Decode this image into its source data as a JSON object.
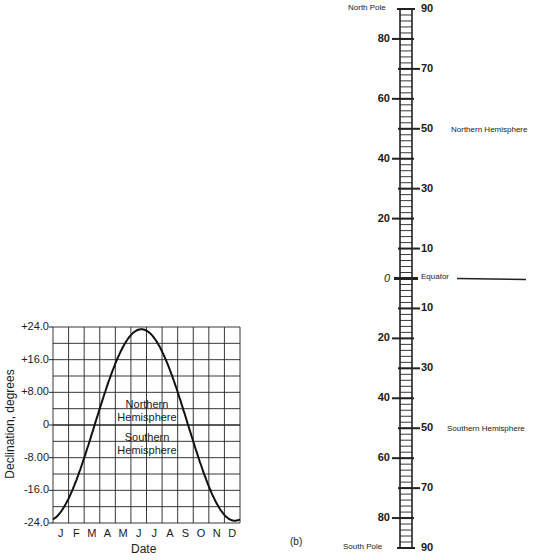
{
  "panel_label": "(b)",
  "chart": {
    "ylabel": "Declination, degrees",
    "xlabel": "Date",
    "yticks": [
      "+24.0",
      "+16.0",
      "+8.00",
      "0",
      "-8.00",
      "-16.0",
      "-24.0"
    ],
    "months": [
      "J",
      "F",
      "M",
      "A",
      "M",
      "J",
      "J",
      "A",
      "S",
      "O",
      "N",
      "D"
    ],
    "region_north": [
      "Northern",
      "Hemisphere"
    ],
    "region_south": [
      "Southern",
      "Hemisphere"
    ]
  },
  "scale": {
    "top_label": "North Pole",
    "bottom_label": "South Pole",
    "equator_label": "Equator",
    "north_label": "Northern Hemisphere",
    "south_label": "Southern Hemisphere",
    "north_ticks": [
      {
        "value": "90",
        "side": "right"
      },
      {
        "value": "80",
        "side": "left"
      },
      {
        "value": "70",
        "side": "right"
      },
      {
        "value": "60",
        "side": "left"
      },
      {
        "value": "50",
        "side": "right"
      },
      {
        "value": "40",
        "side": "left"
      },
      {
        "value": "30",
        "side": "right"
      },
      {
        "value": "20",
        "side": "left"
      },
      {
        "value": "10",
        "side": "right"
      },
      {
        "value": "0",
        "side": "left"
      }
    ],
    "south_ticks": [
      {
        "value": "10",
        "side": "right"
      },
      {
        "value": "20",
        "side": "left"
      },
      {
        "value": "30",
        "side": "right"
      },
      {
        "value": "40",
        "side": "left"
      },
      {
        "value": "50",
        "side": "right"
      },
      {
        "value": "60",
        "side": "left"
      },
      {
        "value": "70",
        "side": "right"
      },
      {
        "value": "80",
        "side": "left"
      },
      {
        "value": "90",
        "side": "right"
      }
    ]
  },
  "chart_data": {
    "type": "line",
    "title": "",
    "xlabel": "Date",
    "ylabel": "Declination, degrees",
    "categories": [
      "J",
      "F",
      "M",
      "A",
      "M",
      "J",
      "J",
      "A",
      "S",
      "O",
      "N",
      "D"
    ],
    "series": [
      {
        "name": "Solar declination",
        "x": [
          "Jan 1",
          "Feb 1",
          "Mar 1",
          "Mar 21",
          "Apr 1",
          "May 1",
          "Jun 1",
          "Jun 21",
          "Jul 1",
          "Aug 1",
          "Sep 1",
          "Sep 23",
          "Oct 1",
          "Nov 1",
          "Dec 1",
          "Dec 21",
          "Dec 31"
        ],
        "values": [
          -23.0,
          -17.3,
          -8.0,
          0.0,
          4.3,
          15.0,
          22.0,
          23.45,
          23.1,
          18.0,
          8.3,
          0.0,
          -3.0,
          -14.3,
          -21.8,
          -23.45,
          -23.1
        ]
      }
    ],
    "ylim": [
      -24.0,
      24.0
    ],
    "yticks": [
      24.0,
      16.0,
      8.0,
      0,
      -8.0,
      -16.0,
      -24.0
    ],
    "grid": true,
    "annotations": [
      "Northern Hemisphere (above 0)",
      "Southern Hemisphere (below 0)"
    ]
  }
}
